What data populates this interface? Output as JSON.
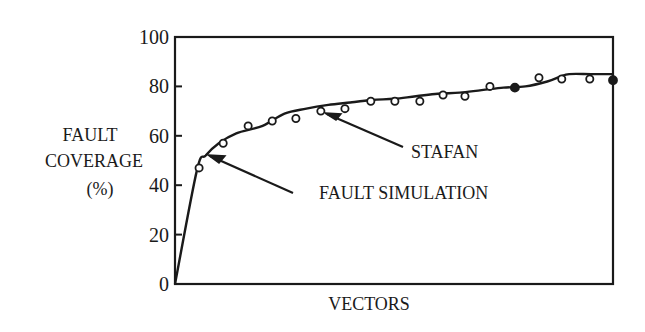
{
  "chart_data": {
    "type": "line",
    "title": "",
    "xlabel": "VECTORS",
    "ylabel": [
      "FAULT",
      "COVERAGE",
      "(%)"
    ],
    "ylim": [
      0,
      100
    ],
    "yticks": [
      0,
      20,
      40,
      60,
      80,
      100
    ],
    "ytick_labels": [
      "0",
      "20",
      "40",
      "60",
      "80",
      "100"
    ],
    "xticks": [],
    "grid": false,
    "legend": null,
    "annotations": [
      {
        "text": "STAFAN",
        "points_to": "STAFAN curve"
      },
      {
        "text": "FAULT SIMULATION",
        "points_to": "fault simulation markers"
      }
    ],
    "series": [
      {
        "name": "STAFAN",
        "style": "solid line",
        "x": [
          0,
          0.05,
          0.07,
          0.1,
          0.14,
          0.2,
          0.25,
          0.3,
          0.35,
          0.4,
          0.45,
          0.5,
          0.55,
          0.6,
          0.65,
          0.7,
          0.75,
          0.8,
          0.85,
          0.88,
          0.9,
          0.95,
          1.0
        ],
        "values": [
          0,
          46,
          52,
          57,
          61,
          64,
          69,
          71,
          72.5,
          73.5,
          74.5,
          75,
          76,
          77,
          77.5,
          78.5,
          79.5,
          80,
          82,
          84,
          85,
          85,
          85
        ]
      },
      {
        "name": "FAULT SIMULATION",
        "style": "circle markers",
        "x": [
          0.055,
          0.11,
          0.167,
          0.222,
          0.276,
          0.333,
          0.388,
          0.447,
          0.502,
          0.559,
          0.612,
          0.662,
          0.719,
          0.776,
          0.831,
          0.883,
          0.947,
          1.0
        ],
        "values": [
          47,
          57,
          64,
          66,
          67,
          70,
          71,
          74,
          74,
          74,
          76.5,
          76,
          80,
          79.5,
          83.5,
          83,
          83,
          82.5
        ],
        "filled": [
          false,
          false,
          false,
          false,
          false,
          false,
          false,
          false,
          false,
          false,
          false,
          false,
          false,
          true,
          false,
          false,
          false,
          true
        ]
      }
    ]
  }
}
